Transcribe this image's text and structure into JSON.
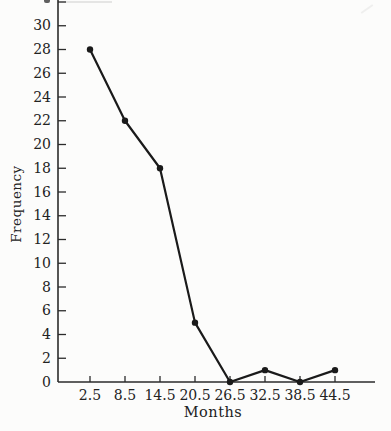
{
  "figure": {
    "background_color": "#fcfcfb",
    "ink_color": "#1a1a1a",
    "axis_color": "#2b2b2b",
    "label_color": "#222222"
  },
  "chart_data": {
    "type": "line",
    "title": "",
    "xlabel": "Months",
    "ylabel": "Frequency",
    "x": [
      2.5,
      8.5,
      14.5,
      20.5,
      26.5,
      32.5,
      38.5,
      44.5
    ],
    "x_tick_labels": [
      "2.5",
      "8.5",
      "14.5",
      "20.5",
      "26.5",
      "32.5",
      "38.5",
      "44.5"
    ],
    "values": [
      28,
      22,
      18,
      5,
      0,
      1,
      0,
      1
    ],
    "y_ticks": [
      0,
      2,
      4,
      6,
      8,
      10,
      12,
      14,
      16,
      18,
      20,
      22,
      24,
      26,
      28,
      30
    ],
    "y_axis_cutoff_tick": 32,
    "ylim": [
      0,
      32
    ],
    "grid": false,
    "legend": null,
    "marker": "filled-circle",
    "line_color": "#1a1a1a"
  }
}
